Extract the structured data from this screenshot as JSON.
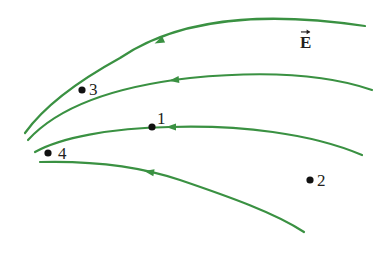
{
  "diagram": {
    "field_label": "E",
    "colors": {
      "field_line": "#3a9142",
      "point": "#111111",
      "text": "#231f20",
      "background": "#ffffff"
    },
    "field_lines": [
      {
        "id": "line-1",
        "path": "M 365 26 C 290 15 190 10 120 58 C 80 80 45 105 25 133",
        "arrow": {
          "x": 160,
          "y": 41,
          "angle": 155
        }
      },
      {
        "id": "line-2",
        "path": "M 372 90 C 320 72 250 72 190 78 C 120 86 60 105 28 140",
        "arrow": {
          "x": 175,
          "y": 80,
          "angle": 173
        }
      },
      {
        "id": "line-3",
        "path": "M 362 155 C 310 133 240 125 170 127 C 110 128 60 138 35 152",
        "arrow": {
          "x": 172,
          "y": 127,
          "angle": 180
        }
      },
      {
        "id": "line-4",
        "path": "M 40 162 C 80 161 130 163 180 180 C 230 197 275 213 304 232",
        "arrow": {
          "x": 150,
          "y": 172,
          "angle": 190
        }
      }
    ],
    "points": [
      {
        "label": "1",
        "x": 152,
        "y": 127,
        "label_x": 157,
        "label_y": 110
      },
      {
        "label": "2",
        "x": 310,
        "y": 180,
        "label_x": 317,
        "label_y": 172
      },
      {
        "label": "3",
        "x": 82,
        "y": 90,
        "label_x": 89,
        "label_y": 81
      },
      {
        "label": "4",
        "x": 48,
        "y": 153,
        "label_x": 58,
        "label_y": 145
      }
    ]
  }
}
